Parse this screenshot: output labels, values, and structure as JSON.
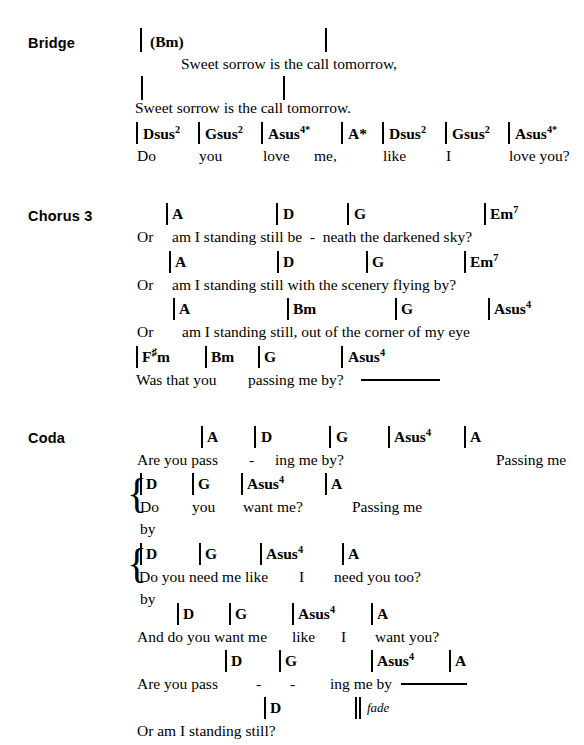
{
  "document": {
    "type": "song-chord-chart",
    "page_width": 584,
    "page_height": 745,
    "text_color": "#000000",
    "background_color": "#ffffff"
  },
  "sections": [
    {
      "id": "bridge",
      "label": "Bridge",
      "label_x": 28,
      "label_y": 35,
      "lines": [
        {
          "chords": [
            {
              "text": "(Bm)",
              "x": 150,
              "y": 34
            }
          ],
          "barlines": [
            {
              "x": 140,
              "y": 28,
              "height": 24
            },
            {
              "x": 325,
              "y": 28,
              "height": 24
            }
          ],
          "lyric": {
            "text": "Sweet sorrow is the call tomorrow,",
            "x": 181,
            "y": 56
          }
        },
        {
          "chords": [],
          "barlines": [
            {
              "x": 141,
              "y": 76,
              "height": 24
            },
            {
              "x": 283,
              "y": 76,
              "height": 24
            }
          ],
          "lyric": {
            "text": "Sweet sorrow is the call tomorrow.",
            "x": 135,
            "y": 100
          }
        },
        {
          "chords": [
            {
              "text": "Dsus",
              "sup": "2",
              "x": 143,
              "y": 126
            },
            {
              "text": "Gsus",
              "sup": "2",
              "x": 205,
              "y": 126
            },
            {
              "text": "Asus",
              "sup": "4*",
              "x": 268,
              "y": 126
            },
            {
              "text": "A*",
              "x": 348,
              "y": 126
            },
            {
              "text": "Dsus",
              "sup": "2",
              "x": 389,
              "y": 126
            },
            {
              "text": "Gsus",
              "sup": "2",
              "x": 452,
              "y": 126
            },
            {
              "text": "Asus",
              "sup": "4*",
              "x": 515,
              "y": 126
            }
          ],
          "barlines": [
            {
              "x": 136,
              "y": 122,
              "height": 22
            },
            {
              "x": 198,
              "y": 122,
              "height": 22
            },
            {
              "x": 261,
              "y": 122,
              "height": 22
            },
            {
              "x": 341,
              "y": 122,
              "height": 22
            },
            {
              "x": 382,
              "y": 122,
              "height": 22
            },
            {
              "x": 445,
              "y": 122,
              "height": 22
            },
            {
              "x": 508,
              "y": 122,
              "height": 22
            }
          ],
          "lyric_parts": [
            {
              "text": "Do",
              "x": 137,
              "y": 148
            },
            {
              "text": "you",
              "x": 199,
              "y": 148
            },
            {
              "text": "love",
              "x": 263,
              "y": 148
            },
            {
              "text": "me,",
              "x": 314,
              "y": 148
            },
            {
              "text": "like",
              "x": 383,
              "y": 148
            },
            {
              "text": "I",
              "x": 446,
              "y": 148
            },
            {
              "text": "love you?",
              "x": 509,
              "y": 148
            }
          ]
        }
      ]
    },
    {
      "id": "chorus-3",
      "label": "Chorus 3",
      "label_x": 28,
      "label_y": 208,
      "lines": [
        {
          "chords": [
            {
              "text": "A",
              "x": 172,
              "y": 206
            },
            {
              "text": "D",
              "x": 283,
              "y": 206
            },
            {
              "text": "G",
              "x": 354,
              "y": 206
            },
            {
              "text": "Em",
              "sup": "7",
              "x": 490,
              "y": 206
            }
          ],
          "barlines": [
            {
              "x": 166,
              "y": 203,
              "height": 22
            },
            {
              "x": 276,
              "y": 203,
              "height": 22
            },
            {
              "x": 347,
              "y": 203,
              "height": 22
            },
            {
              "x": 484,
              "y": 203,
              "height": 22
            }
          ],
          "lyric_parts": [
            {
              "text": "Or",
              "x": 137,
              "y": 229
            },
            {
              "text": "am I standing still be  -  neath the darkened sky?",
              "x": 172,
              "y": 229
            }
          ]
        },
        {
          "chords": [
            {
              "text": "A",
              "x": 175,
              "y": 254
            },
            {
              "text": "D",
              "x": 283,
              "y": 254
            },
            {
              "text": "G",
              "x": 372,
              "y": 254
            },
            {
              "text": "Em",
              "sup": "7",
              "x": 470,
              "y": 254
            }
          ],
          "barlines": [
            {
              "x": 169,
              "y": 251,
              "height": 22
            },
            {
              "x": 277,
              "y": 251,
              "height": 22
            },
            {
              "x": 366,
              "y": 251,
              "height": 22
            },
            {
              "x": 464,
              "y": 251,
              "height": 22
            }
          ],
          "lyric_parts": [
            {
              "text": "Or",
              "x": 137,
              "y": 277
            },
            {
              "text": "am I standing still with the scenery flying by?",
              "x": 172,
              "y": 277
            }
          ]
        },
        {
          "chords": [
            {
              "text": "A",
              "x": 179,
              "y": 301
            },
            {
              "text": "Bm",
              "x": 293,
              "y": 301
            },
            {
              "text": "G",
              "x": 401,
              "y": 301
            },
            {
              "text": "Asus",
              "sup": "4",
              "x": 494,
              "y": 301
            }
          ],
          "barlines": [
            {
              "x": 173,
              "y": 298,
              "height": 22
            },
            {
              "x": 287,
              "y": 298,
              "height": 22
            },
            {
              "x": 395,
              "y": 298,
              "height": 22
            },
            {
              "x": 488,
              "y": 298,
              "height": 22
            }
          ],
          "lyric_parts": [
            {
              "text": "Or",
              "x": 137,
              "y": 324
            },
            {
              "text": "am I standing still, out of the corner of my eye",
              "x": 182,
              "y": 324
            }
          ]
        },
        {
          "chords": [
            {
              "text": "F",
              "sharp": "♯",
              "suffix": "m",
              "x": 142,
              "y": 349
            },
            {
              "text": "Bm",
              "x": 211,
              "y": 349
            },
            {
              "text": "G",
              "x": 264,
              "y": 349
            },
            {
              "text": "Asus",
              "sup": "4",
              "x": 348,
              "y": 349
            }
          ],
          "barlines": [
            {
              "x": 136,
              "y": 346,
              "height": 22
            },
            {
              "x": 205,
              "y": 346,
              "height": 22
            },
            {
              "x": 258,
              "y": 346,
              "height": 22
            },
            {
              "x": 341,
              "y": 346,
              "height": 22
            }
          ],
          "lyric_parts": [
            {
              "text": "Was that you",
              "x": 136,
              "y": 372
            },
            {
              "text": "passing me by?",
              "x": 248,
              "y": 372
            }
          ],
          "hold_line": {
            "x": 361,
            "y": 379,
            "width": 79
          }
        }
      ]
    },
    {
      "id": "coda",
      "label": "Coda",
      "label_x": 28,
      "label_y": 430,
      "lines": [
        {
          "chords": [
            {
              "text": "A",
              "x": 207,
              "y": 429
            },
            {
              "text": "D",
              "x": 261,
              "y": 429
            },
            {
              "text": "G",
              "x": 336,
              "y": 429
            },
            {
              "text": "Asus",
              "sup": "4",
              "x": 394,
              "y": 429
            },
            {
              "text": "A",
              "x": 470,
              "y": 429
            }
          ],
          "barlines": [
            {
              "x": 201,
              "y": 426,
              "height": 22
            },
            {
              "x": 254,
              "y": 426,
              "height": 22
            },
            {
              "x": 329,
              "y": 426,
              "height": 22
            },
            {
              "x": 388,
              "y": 426,
              "height": 22
            },
            {
              "x": 464,
              "y": 426,
              "height": 22
            }
          ],
          "lyric_parts": [
            {
              "text": "Are you pass",
              "x": 137,
              "y": 452
            },
            {
              "text": "-",
              "x": 249,
              "y": 452
            },
            {
              "text": "ing me by?",
              "x": 275,
              "y": 452
            },
            {
              "text": "Passing me",
              "x": 496,
              "y": 452
            }
          ]
        },
        {
          "brace": {
            "x": 127,
            "y": 473,
            "height": 45
          },
          "chords": [
            {
              "text": "D",
              "x": 146,
              "y": 476
            },
            {
              "text": "G",
              "x": 198,
              "y": 476
            },
            {
              "text": "Asus",
              "sup": "4",
              "x": 247,
              "y": 476
            },
            {
              "text": "A",
              "x": 331,
              "y": 476
            }
          ],
          "barlines": [
            {
              "x": 140,
              "y": 473,
              "height": 22
            },
            {
              "x": 192,
              "y": 473,
              "height": 22
            },
            {
              "x": 241,
              "y": 473,
              "height": 22
            },
            {
              "x": 325,
              "y": 473,
              "height": 22
            }
          ],
          "lyric_parts": [
            {
              "text": "Do",
              "x": 140,
              "y": 499
            },
            {
              "text": "you",
              "x": 192,
              "y": 499
            },
            {
              "text": "want me?",
              "x": 243,
              "y": 499
            },
            {
              "text": "Passing me",
              "x": 352,
              "y": 499
            }
          ],
          "lyric_alt": {
            "text": "by",
            "x": 140,
            "y": 521
          }
        },
        {
          "brace": {
            "x": 127,
            "y": 543,
            "height": 45
          },
          "chords": [
            {
              "text": "D",
              "x": 146,
              "y": 546
            },
            {
              "text": "G",
              "x": 205,
              "y": 546
            },
            {
              "text": "Asus",
              "sup": "4",
              "x": 266,
              "y": 546
            },
            {
              "text": "A",
              "x": 348,
              "y": 546
            }
          ],
          "barlines": [
            {
              "x": 140,
              "y": 543,
              "height": 22
            },
            {
              "x": 199,
              "y": 543,
              "height": 22
            },
            {
              "x": 260,
              "y": 543,
              "height": 22
            },
            {
              "x": 342,
              "y": 543,
              "height": 22
            }
          ],
          "lyric_parts": [
            {
              "text": "Do you need me like",
              "x": 139,
              "y": 569
            },
            {
              "text": "I",
              "x": 299,
              "y": 569
            },
            {
              "text": "need you too?",
              "x": 334,
              "y": 569
            }
          ],
          "lyric_alt": {
            "text": "by",
            "x": 140,
            "y": 591
          }
        },
        {
          "chords": [
            {
              "text": "D",
              "x": 183,
              "y": 606
            },
            {
              "text": "G",
              "x": 235,
              "y": 606
            },
            {
              "text": "Asus",
              "sup": "4",
              "x": 298,
              "y": 606
            },
            {
              "text": "A",
              "x": 377,
              "y": 606
            }
          ],
          "barlines": [
            {
              "x": 177,
              "y": 603,
              "height": 22
            },
            {
              "x": 229,
              "y": 603,
              "height": 22
            },
            {
              "x": 292,
              "y": 603,
              "height": 22
            },
            {
              "x": 371,
              "y": 603,
              "height": 22
            }
          ],
          "lyric_parts": [
            {
              "text": "And do you want me",
              "x": 137,
              "y": 629
            },
            {
              "text": "like",
              "x": 292,
              "y": 629
            },
            {
              "text": "I",
              "x": 341,
              "y": 629
            },
            {
              "text": "want you?",
              "x": 375,
              "y": 629
            }
          ]
        },
        {
          "chords": [
            {
              "text": "D",
              "x": 231,
              "y": 653
            },
            {
              "text": "G",
              "x": 285,
              "y": 653
            },
            {
              "text": "Asus",
              "sup": "4",
              "x": 377,
              "y": 653
            },
            {
              "text": "A",
              "x": 455,
              "y": 653
            }
          ],
          "barlines": [
            {
              "x": 225,
              "y": 650,
              "height": 22
            },
            {
              "x": 279,
              "y": 650,
              "height": 22
            },
            {
              "x": 371,
              "y": 650,
              "height": 22
            },
            {
              "x": 449,
              "y": 650,
              "height": 22
            }
          ],
          "lyric_parts": [
            {
              "text": "Are you pass",
              "x": 137,
              "y": 676
            },
            {
              "text": "-",
              "x": 256,
              "y": 676
            },
            {
              "text": "-",
              "x": 290,
              "y": 676
            },
            {
              "text": "ing me by",
              "x": 330,
              "y": 676
            }
          ],
          "hold_line": {
            "x": 401,
            "y": 683,
            "width": 66
          }
        },
        {
          "chords": [
            {
              "text": "D",
              "x": 270,
              "y": 700
            }
          ],
          "barlines": [
            {
              "x": 264,
              "y": 697,
              "height": 22
            }
          ],
          "double_barline": {
            "x": 355,
            "y": 697,
            "height": 22
          },
          "fade": {
            "text": "fade",
            "x": 367,
            "y": 701
          },
          "lyric_parts": [
            {
              "text": "Or am I standing still?",
              "x": 137,
              "y": 723
            }
          ]
        }
      ]
    }
  ]
}
